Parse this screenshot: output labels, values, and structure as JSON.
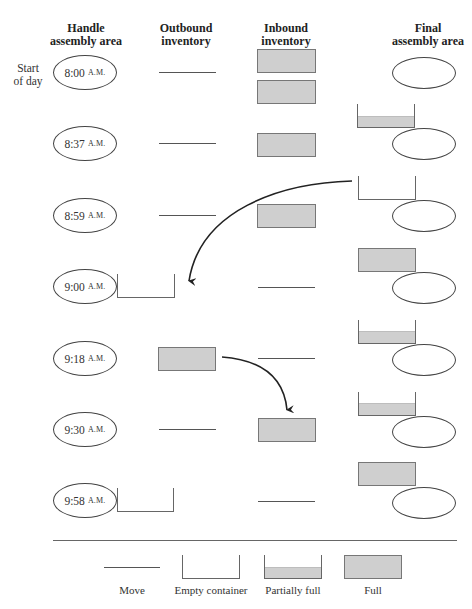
{
  "headers": {
    "handle": [
      "Handle",
      "assembly area"
    ],
    "outbound": [
      "Outbound",
      "inventory"
    ],
    "inbound": [
      "Inbound",
      "inventory"
    ],
    "final": [
      "Final",
      "assembly area"
    ]
  },
  "start_of_day": [
    "Start",
    "of day"
  ],
  "rows": [
    {
      "time": "8:00",
      "ampm": "A.M.",
      "handle_container": "none",
      "outbound": "move",
      "inbound": [
        "full",
        "full"
      ],
      "final_container": "none"
    },
    {
      "time": "8:37",
      "ampm": "A.M.",
      "handle_container": "none",
      "outbound": "move",
      "inbound": [
        "full"
      ],
      "final_container": "partial"
    },
    {
      "time": "8:59",
      "ampm": "A.M.",
      "handle_container": "none",
      "outbound": "move",
      "inbound": [
        "full"
      ],
      "final_container": "empty"
    },
    {
      "time": "9:00",
      "ampm": "A.M.",
      "handle_container": "empty",
      "outbound": "none",
      "inbound": [
        "move"
      ],
      "final_container": "full"
    },
    {
      "time": "9:18",
      "ampm": "A.M.",
      "handle_container": "none",
      "outbound": "full",
      "inbound": [
        "move"
      ],
      "final_container": "partial"
    },
    {
      "time": "9:30",
      "ampm": "A.M.",
      "handle_container": "none",
      "outbound": "move",
      "inbound": [
        "full"
      ],
      "final_container": "partial"
    },
    {
      "time": "9:58",
      "ampm": "A.M.",
      "handle_container": "empty",
      "outbound": "none",
      "inbound": [
        "move"
      ],
      "final_container": "full"
    }
  ],
  "arrows": [
    {
      "from": "final-assembly empty container (8:59)",
      "to": "outbound inventory (9:00)"
    },
    {
      "from": "outbound full container (9:18)",
      "to": "inbound inventory (9:30)"
    }
  ],
  "legend": {
    "move": "Move",
    "empty": "Empty container",
    "partial": "Partially full",
    "full": "Full"
  },
  "colors": {
    "container_fill": "#cfcfcf",
    "stroke": "#555555"
  }
}
